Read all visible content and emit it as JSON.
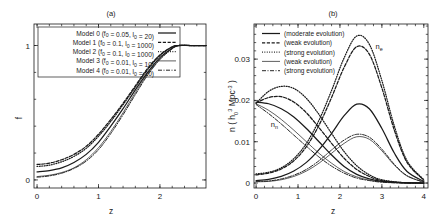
{
  "figure": {
    "panel_a_title": "(a)",
    "panel_b_title": "(b)"
  },
  "panel_a": {
    "name": "panel-a",
    "xlabel": "z",
    "ylabel": "f",
    "xticks": [
      "0",
      "1",
      "2"
    ],
    "yticks": [
      "0",
      "1"
    ],
    "legend": [
      {
        "label": "Model 0 (f",
        "sub1": "0",
        "mid": " = 0.05, l",
        "sub2": "0",
        "tail": " = 20)",
        "style": "solid"
      },
      {
        "label": "Model 1 (f",
        "sub1": "0",
        "mid": " = 0.1, l",
        "sub2": "0",
        "tail": " = 1000)",
        "style": "dashed"
      },
      {
        "label": "Model 2 (f",
        "sub1": "0",
        "mid": " = 0.1, l",
        "sub2": "0",
        "tail": " = 1000)",
        "style": "dotted"
      },
      {
        "label": "Model 3 (f",
        "sub1": "0",
        "mid": " = 0.01, l",
        "sub2": "0",
        "tail": " = 10)",
        "style": "thin-solid"
      },
      {
        "label": "Model 4 (f",
        "sub1": "0",
        "mid": " = 0.01, l",
        "sub2": "0",
        "tail": " = 10)",
        "style": "dashdot"
      }
    ]
  },
  "panel_b": {
    "name": "panel-b",
    "xlabel": "z",
    "ylabel_prefix": "n ( h",
    "ylabel_sup1": "3",
    "ylabel_sub1": "0",
    "ylabel_mid": " Mpc",
    "ylabel_sup2": "-3",
    "ylabel_tail": " )",
    "xticks": [
      "0",
      "1",
      "2",
      "3",
      "4"
    ],
    "yticks": [
      "0",
      "0.01",
      "0.02",
      "0.03"
    ],
    "curve_label_ne": "n",
    "curve_label_ne_sub": "e",
    "curve_label_nn": "n",
    "curve_label_nn_sub": "n",
    "legend": [
      {
        "label": "(moderate evolution)",
        "style": "solid"
      },
      {
        "label": "(weak evolution)",
        "style": "dashed"
      },
      {
        "label": "(strong evolution)",
        "style": "dotted"
      },
      {
        "label": "(weak evolution)",
        "style": "thin-solid"
      },
      {
        "label": "(strong evolution)",
        "style": "dashdot"
      }
    ]
  },
  "chart_data": [
    {
      "type": "line",
      "title": "(a)",
      "xlabel": "z",
      "ylabel": "f",
      "xlim": [
        -0.05,
        2.75
      ],
      "ylim": [
        -0.06,
        1.16
      ],
      "xticks": [
        0,
        1,
        2
      ],
      "yticks": [
        0,
        1
      ],
      "grid": false,
      "legend_position": "top-left-inside",
      "description": "Sigmoid-like fraction f rising from near 0 at z=0 to saturate at 1 by z~2.3 for five models.",
      "series": [
        {
          "name": "Model 0 (f0 = 0.05, l0 = 20)",
          "style": "solid",
          "x": [
            0,
            0.2,
            0.4,
            0.6,
            0.8,
            1.0,
            1.2,
            1.4,
            1.6,
            1.8,
            2.0,
            2.2,
            2.3,
            2.5,
            2.75
          ],
          "y": [
            0.06,
            0.07,
            0.09,
            0.13,
            0.19,
            0.28,
            0.4,
            0.53,
            0.67,
            0.8,
            0.91,
            0.98,
            1.0,
            1.0,
            1.0
          ]
        },
        {
          "name": "Model 1 (f0 = 0.1, l0 = 1000)",
          "style": "dashed",
          "x": [
            0,
            0.2,
            0.4,
            0.6,
            0.8,
            1.0,
            1.2,
            1.4,
            1.6,
            1.8,
            2.0,
            2.2,
            2.3,
            2.5,
            2.75
          ],
          "y": [
            0.115,
            0.125,
            0.15,
            0.19,
            0.25,
            0.34,
            0.45,
            0.57,
            0.7,
            0.83,
            0.93,
            0.99,
            1.0,
            1.0,
            1.0
          ]
        },
        {
          "name": "Model 2 (f0 = 0.1, l0 = 1000)",
          "style": "dotted",
          "x": [
            0,
            0.2,
            0.4,
            0.6,
            0.8,
            1.0,
            1.2,
            1.4,
            1.6,
            1.8,
            2.0,
            2.2,
            2.3,
            2.5,
            2.75
          ],
          "y": [
            0.1,
            0.11,
            0.135,
            0.175,
            0.235,
            0.325,
            0.435,
            0.56,
            0.69,
            0.82,
            0.925,
            0.99,
            1.0,
            1.0,
            1.0
          ]
        },
        {
          "name": "Model 3 (f0 = 0.01, l0 = 10)",
          "style": "thin-solid",
          "x": [
            0,
            0.2,
            0.4,
            0.6,
            0.8,
            1.0,
            1.2,
            1.4,
            1.6,
            1.8,
            2.0,
            2.2,
            2.3,
            2.5,
            2.75
          ],
          "y": [
            0.025,
            0.035,
            0.055,
            0.09,
            0.15,
            0.24,
            0.36,
            0.5,
            0.65,
            0.79,
            0.9,
            0.98,
            1.0,
            1.0,
            1.0
          ]
        },
        {
          "name": "Model 4 (f0 = 0.01, l0 = 10)",
          "style": "dashdot",
          "x": [
            0,
            0.2,
            0.4,
            0.6,
            0.8,
            1.0,
            1.2,
            1.4,
            1.6,
            1.8,
            2.0,
            2.2,
            2.3,
            2.5,
            2.75
          ],
          "y": [
            0.02,
            0.03,
            0.05,
            0.085,
            0.14,
            0.225,
            0.345,
            0.485,
            0.635,
            0.78,
            0.895,
            0.975,
            1.0,
            1.0,
            1.0
          ]
        }
      ]
    },
    {
      "type": "line",
      "title": "(b)",
      "xlabel": "z",
      "ylabel": "n ( h0^3 Mpc^-3 )",
      "xlim": [
        -0.05,
        4.1
      ],
      "ylim": [
        -0.0012,
        0.0385
      ],
      "xticks": [
        0,
        1,
        2,
        3,
        4
      ],
      "yticks": [
        0,
        0.01,
        0.02,
        0.03
      ],
      "grid": false,
      "legend_position": "top-left-inside",
      "annotations": [
        {
          "text": "n_e",
          "x": 2.85,
          "y": 0.0325
        },
        {
          "text": "n_n",
          "x": 0.35,
          "y": 0.0135
        }
      ],
      "description": "Number densities: n_n curves decline from ~0.02 at z=0, n_e curves peak near z=2.4.",
      "series": [
        {
          "name": "n_n (moderate evolution)",
          "style": "solid",
          "x": [
            0,
            0.3,
            0.6,
            0.9,
            1.2,
            1.5,
            1.8,
            2.1,
            2.4,
            2.7,
            3.0,
            3.5,
            4.0
          ],
          "y": [
            0.0196,
            0.0192,
            0.018,
            0.016,
            0.0132,
            0.01,
            0.0068,
            0.004,
            0.0021,
            0.001,
            0.0004,
            0.0001,
            0.0
          ]
        },
        {
          "name": "n_n (weak evolution)",
          "style": "dashed",
          "x": [
            0,
            0.3,
            0.6,
            0.9,
            1.2,
            1.5,
            1.8,
            2.1,
            2.4,
            2.7,
            3.0,
            3.5,
            4.0
          ],
          "y": [
            0.0194,
            0.0207,
            0.0209,
            0.0196,
            0.017,
            0.0134,
            0.0096,
            0.006,
            0.0033,
            0.0016,
            0.0006,
            0.0001,
            0.0
          ]
        },
        {
          "name": "n_n (strong evolution)",
          "style": "dotted",
          "x": [
            0,
            0.3,
            0.6,
            0.9,
            1.2,
            1.5,
            1.8,
            2.1,
            2.4,
            2.7,
            3.0,
            3.5,
            4.0
          ],
          "y": [
            0.0193,
            0.0222,
            0.0234,
            0.0229,
            0.0205,
            0.0166,
            0.012,
            0.0076,
            0.0042,
            0.002,
            0.0008,
            0.0001,
            0.0
          ]
        },
        {
          "name": "n_n (weak evolution, thin)",
          "style": "thin-solid",
          "x": [
            0,
            0.3,
            0.6,
            0.9,
            1.2,
            1.5,
            1.8,
            2.1,
            2.4,
            2.7,
            3.0,
            3.5,
            4.0
          ],
          "y": [
            0.0192,
            0.0176,
            0.0154,
            0.0128,
            0.01,
            0.0072,
            0.0048,
            0.0028,
            0.0015,
            0.0007,
            0.0003,
            0.0,
            0.0
          ]
        },
        {
          "name": "n_n (strong evolution, dashdot)",
          "style": "dashdot",
          "x": [
            0,
            0.3,
            0.6,
            0.9,
            1.2,
            1.5,
            1.8,
            2.1,
            2.4,
            2.7,
            3.0,
            3.5,
            4.0
          ],
          "y": [
            0.019,
            0.0168,
            0.0143,
            0.0116,
            0.0089,
            0.0063,
            0.0041,
            0.0024,
            0.0012,
            0.0006,
            0.0002,
            0.0,
            0.0
          ]
        },
        {
          "name": "n_e (moderate evolution)",
          "style": "solid",
          "x": [
            0,
            0.3,
            0.6,
            0.9,
            1.2,
            1.5,
            1.8,
            2.1,
            2.4,
            2.7,
            3.0,
            3.3,
            3.6,
            4.0
          ],
          "y": [
            0.0006,
            0.0009,
            0.0016,
            0.0029,
            0.005,
            0.0081,
            0.012,
            0.0163,
            0.0191,
            0.018,
            0.0132,
            0.0072,
            0.0028,
            0.0004
          ]
        },
        {
          "name": "n_e (weak evolution)",
          "style": "dashed",
          "x": [
            0,
            0.3,
            0.6,
            0.9,
            1.2,
            1.5,
            1.8,
            2.1,
            2.4,
            2.7,
            3.0,
            3.3,
            3.6,
            4.0
          ],
          "y": [
            0.002,
            0.0024,
            0.0034,
            0.0054,
            0.0088,
            0.014,
            0.0207,
            0.028,
            0.033,
            0.0312,
            0.023,
            0.0127,
            0.005,
            0.0007
          ]
        },
        {
          "name": "n_e (strong evolution)",
          "style": "dotted",
          "x": [
            0,
            0.3,
            0.6,
            0.9,
            1.2,
            1.5,
            1.8,
            2.1,
            2.4,
            2.7,
            3.0,
            3.3,
            3.6,
            4.0
          ],
          "y": [
            0.0022,
            0.0026,
            0.0037,
            0.0059,
            0.0096,
            0.0152,
            0.0224,
            0.0303,
            0.0356,
            0.0336,
            0.0248,
            0.0137,
            0.0054,
            0.0008
          ]
        },
        {
          "name": "n_e (weak evolution, thin)",
          "style": "thin-solid",
          "x": [
            0,
            0.3,
            0.6,
            0.9,
            1.2,
            1.5,
            1.8,
            2.1,
            2.4,
            2.7,
            3.0,
            3.3,
            3.6,
            4.0
          ],
          "y": [
            0.0003,
            0.0004,
            0.0008,
            0.0016,
            0.0029,
            0.0048,
            0.0072,
            0.0096,
            0.0112,
            0.0106,
            0.0078,
            0.0043,
            0.0017,
            0.0002
          ]
        },
        {
          "name": "n_e (strong evolution, dashdot)",
          "style": "dashdot",
          "x": [
            0,
            0.3,
            0.6,
            0.9,
            1.2,
            1.5,
            1.8,
            2.1,
            2.4,
            2.7,
            3.0,
            3.3,
            3.6,
            4.0
          ],
          "y": [
            0.0004,
            0.0005,
            0.001,
            0.0019,
            0.0033,
            0.0054,
            0.008,
            0.0104,
            0.0118,
            0.0111,
            0.0082,
            0.0045,
            0.0018,
            0.0002
          ]
        }
      ]
    }
  ]
}
